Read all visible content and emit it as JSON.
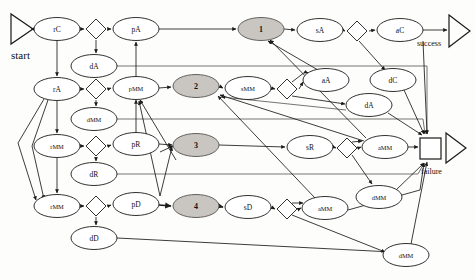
{
  "diagram": {
    "inputs": [
      {
        "name": "start",
        "label": "start",
        "x": 11,
        "y": 14,
        "w": 22,
        "h": 30
      }
    ],
    "outputs": [
      {
        "name": "success",
        "label": "success",
        "x": 448,
        "y": 16,
        "w": 22,
        "h": 32,
        "label_x": 417,
        "label_y": 44
      },
      {
        "name": "failure",
        "label": "failure",
        "x": 444,
        "y": 133,
        "w": 20,
        "h": 30,
        "label_x": 423,
        "label_y": 172
      }
    ],
    "boxes": [
      {
        "name": "failure-junction",
        "x": 420,
        "y": 138,
        "w": 21,
        "h": 21
      }
    ],
    "ellipses": [
      {
        "id": "rC",
        "label": "rC",
        "cx": 57,
        "cy": 29,
        "shaded": false
      },
      {
        "id": "pA",
        "label": "pA",
        "cx": 136,
        "cy": 29,
        "shaded": false
      },
      {
        "id": "s1",
        "label": "1",
        "cx": 261,
        "cy": 29,
        "shaded": true
      },
      {
        "id": "sA",
        "label": "sA",
        "cx": 320,
        "cy": 30,
        "shaded": false
      },
      {
        "id": "aC",
        "label": "aC",
        "cx": 400,
        "cy": 30,
        "shaded": false
      },
      {
        "id": "dA1",
        "label": "dA",
        "cx": 94,
        "cy": 66,
        "shaded": false
      },
      {
        "id": "rA",
        "label": "rA",
        "cx": 57,
        "cy": 89,
        "shaded": false
      },
      {
        "id": "pMM",
        "label": "pMM",
        "cx": 136,
        "cy": 88,
        "shaded": false
      },
      {
        "id": "s2",
        "label": "2",
        "cx": 196,
        "cy": 86,
        "shaded": true
      },
      {
        "id": "sMM",
        "label": "sMM",
        "cx": 248,
        "cy": 88,
        "shaded": false
      },
      {
        "id": "aA",
        "label": "aA",
        "cx": 326,
        "cy": 80,
        "shaded": false
      },
      {
        "id": "dC",
        "label": "dC",
        "cx": 393,
        "cy": 80,
        "shaded": false
      },
      {
        "id": "dMM1",
        "label": "dMM",
        "cx": 94,
        "cy": 119,
        "shaded": false
      },
      {
        "id": "dA2",
        "label": "dA",
        "cx": 369,
        "cy": 105,
        "shaded": false
      },
      {
        "id": "rMM1",
        "label": "rMM",
        "cx": 57,
        "cy": 146,
        "shaded": false
      },
      {
        "id": "pR",
        "label": "pR",
        "cx": 136,
        "cy": 144,
        "shaded": false
      },
      {
        "id": "s3",
        "label": "3",
        "cx": 196,
        "cy": 145,
        "shaded": true
      },
      {
        "id": "sR",
        "label": "sR",
        "cx": 310,
        "cy": 147,
        "shaded": false
      },
      {
        "id": "aMM1",
        "label": "aMM",
        "cx": 385,
        "cy": 147,
        "shaded": false
      },
      {
        "id": "dR",
        "label": "dR",
        "cx": 94,
        "cy": 174,
        "shaded": false
      },
      {
        "id": "dMM2",
        "label": "dMM",
        "cx": 379,
        "cy": 197,
        "shaded": false
      },
      {
        "id": "rMM2",
        "label": "rMM",
        "cx": 57,
        "cy": 206,
        "shaded": false
      },
      {
        "id": "pD",
        "label": "pD",
        "cx": 136,
        "cy": 204,
        "shaded": false
      },
      {
        "id": "s4",
        "label": "4",
        "cx": 196,
        "cy": 206,
        "shaded": true
      },
      {
        "id": "sD",
        "label": "sD",
        "cx": 248,
        "cy": 207,
        "shaded": false
      },
      {
        "id": "aMM2",
        "label": "aMM",
        "cx": 325,
        "cy": 208,
        "shaded": false
      },
      {
        "id": "dD",
        "label": "dD",
        "cx": 94,
        "cy": 238,
        "shaded": false
      },
      {
        "id": "dMM3",
        "label": "dMM",
        "cx": 406,
        "cy": 255,
        "shaded": false
      }
    ],
    "diamonds": [
      {
        "name": "branch-rC",
        "cx": 96,
        "cy": 29
      },
      {
        "name": "branch-rA",
        "cx": 96,
        "cy": 89
      },
      {
        "name": "branch-sA",
        "cx": 357,
        "cy": 31
      },
      {
        "name": "branch-sMM",
        "cx": 287,
        "cy": 89
      },
      {
        "name": "branch-rMM1",
        "cx": 96,
        "cy": 146
      },
      {
        "name": "branch-sR",
        "cx": 347,
        "cy": 148
      },
      {
        "name": "branch-rMM2",
        "cx": 96,
        "cy": 206
      },
      {
        "name": "branch-sD",
        "cx": 287,
        "cy": 209
      }
    ],
    "ellipse_size": {
      "rx": 23,
      "ry": 11.5
    },
    "diamond_size": {
      "r": 10
    },
    "colors": {
      "shaded_fill": "#c9c6c2",
      "node_fill": "#ffffff",
      "stroke": "#1a1a1a",
      "background": "#fdfdfb"
    }
  }
}
